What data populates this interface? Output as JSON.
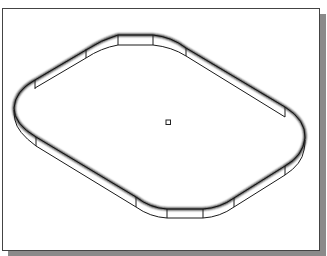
{
  "figure": {
    "description": "Isometric CAD view of a rounded-rectangle ring (frame) with tessellated wall segments and a small center point marker",
    "colors": {
      "background": "#ffffff",
      "border": "#444444",
      "shadow": "#8a8a8a",
      "line": "#1a1a1a"
    },
    "shape": {
      "type": "rounded-rectangle-ring",
      "view": "isometric",
      "segment_lines": 12
    },
    "center_marker": {
      "shape": "square",
      "x": 168,
      "y": 122
    }
  }
}
